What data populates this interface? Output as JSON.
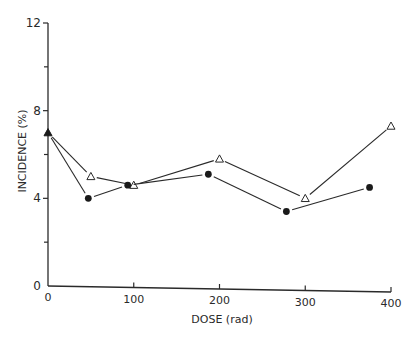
{
  "chart_data": {
    "type": "line",
    "title": "",
    "xlabel": "DOSE (rad)",
    "ylabel": "INCIDENCE (%)",
    "xlim": [
      0,
      400
    ],
    "ylim": [
      0,
      12
    ],
    "x_ticks": [
      0,
      100,
      200,
      300,
      400
    ],
    "x_tick_labels": [
      "0",
      "100",
      "200",
      "300",
      "400"
    ],
    "y_ticks": [
      0,
      4,
      8,
      12
    ],
    "y_tick_labels": [
      "0",
      "4",
      "8",
      "12"
    ],
    "y_minor_ticks": [
      2,
      6,
      10
    ],
    "grid": false,
    "legend": null,
    "series": [
      {
        "name": "open triangles",
        "marker": "open-triangle",
        "x": [
          0,
          50,
          100,
          200,
          300,
          400
        ],
        "y": [
          7.0,
          5.0,
          4.6,
          5.8,
          4.0,
          7.3
        ]
      },
      {
        "name": "filled circles",
        "marker": "filled-circle",
        "x": [
          0,
          47,
          93,
          187,
          278,
          375
        ],
        "y": [
          7.0,
          4.0,
          4.6,
          5.1,
          3.4,
          4.5
        ]
      }
    ],
    "annotations": [
      {
        "note": "Shared control point at dose 0 drawn as filled triangle",
        "x": 0,
        "y": 7.0
      }
    ]
  },
  "colors": {
    "ink": "#2a2a2a",
    "background": "#ffffff"
  }
}
